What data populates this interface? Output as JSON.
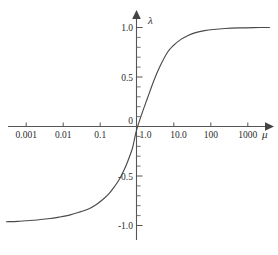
{
  "chart_data": {
    "type": "line",
    "title": "",
    "subtitle": "",
    "xlabel": "μ",
    "ylabel": "λ",
    "x_scale": "log10",
    "grid": false,
    "legend": null,
    "annotations": [],
    "xlim": [
      0.0003,
      4000
    ],
    "ylim": [
      -1.15,
      1.15
    ],
    "x_tick_labels": [
      "0.001",
      "0.01",
      "0.1",
      "1.0",
      "10.0",
      "100",
      "1000"
    ],
    "x_tick_values": [
      0.001,
      0.01,
      0.1,
      1.0,
      10.0,
      100,
      1000
    ],
    "y_tick_labels": [
      "1.0",
      "0.5",
      "0",
      "-0.5",
      "-1.0"
    ],
    "y_tick_values": [
      1.0,
      0.5,
      0,
      -0.5,
      -1.0
    ],
    "y_minor_ticks": [
      0.9,
      0.8,
      0.7,
      0.6,
      0.4,
      0.3,
      0.2,
      0.1,
      -0.1,
      -0.2,
      -0.3,
      -0.4,
      -0.6,
      -0.7,
      -0.8,
      -0.9
    ],
    "origin_label": "0",
    "series": [
      {
        "name": "lambda(mu)",
        "color": "#4a4a4a",
        "x": [
          0.0003,
          0.0006,
          0.001,
          0.002,
          0.004,
          0.008,
          0.016,
          0.03,
          0.05,
          0.08,
          0.12,
          0.18,
          0.25,
          0.35,
          0.5,
          0.7,
          0.8,
          1.0,
          1.4,
          2.0,
          3.0,
          4.5,
          7.0,
          10.0,
          16.0,
          25.0,
          40.0,
          70.0,
          120.0,
          250.0,
          600.0,
          1500.0,
          4000.0
        ],
        "y": [
          -0.962,
          -0.958,
          -0.952,
          -0.944,
          -0.932,
          -0.915,
          -0.893,
          -0.862,
          -0.833,
          -0.79,
          -0.74,
          -0.678,
          -0.61,
          -0.528,
          -0.41,
          -0.27,
          -0.2,
          -0.04,
          0.13,
          0.29,
          0.47,
          0.62,
          0.752,
          0.818,
          0.88,
          0.92,
          0.948,
          0.968,
          0.98,
          0.99,
          0.996,
          0.999,
          1.0
        ]
      }
    ],
    "asymptotes": {
      "upper": 1.0,
      "lower": -1.0
    }
  },
  "colors": {
    "background": "#ffffff",
    "axis": "#555555",
    "curve": "#4a4a4a",
    "text": "#2b2b2b"
  }
}
